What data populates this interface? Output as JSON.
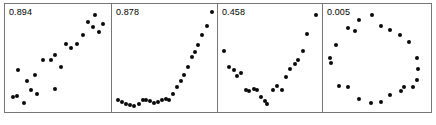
{
  "figure": {
    "name": "scatterplot-correlation-panels",
    "background": "#ffffff",
    "dot_color": "#0a0a0a",
    "border_color": "#777777",
    "panel_count": 4
  },
  "chart_data": [
    {
      "type": "scatter",
      "title": "0.894",
      "annotation": "0.894",
      "xlabel": "",
      "ylabel": "",
      "xlim": [
        0,
        1
      ],
      "ylim": [
        0,
        1
      ],
      "grid": false,
      "legend": null,
      "pattern": "positive-linear",
      "points": [
        [
          0.03,
          0.12
        ],
        [
          0.075,
          0.13
        ],
        [
          0.14,
          0.06
        ],
        [
          0.085,
          0.395
        ],
        [
          0.17,
          0.285
        ],
        [
          0.215,
          0.195
        ],
        [
          0.26,
          0.345
        ],
        [
          0.28,
          0.155
        ],
        [
          0.34,
          0.49
        ],
        [
          0.42,
          0.495
        ],
        [
          0.455,
          0.545
        ],
        [
          0.46,
          0.205
        ],
        [
          0.52,
          0.425
        ],
        [
          0.575,
          0.65
        ],
        [
          0.625,
          0.615
        ],
        [
          0.68,
          0.655
        ],
        [
          0.745,
          0.74
        ],
        [
          0.8,
          0.875
        ],
        [
          0.845,
          0.82
        ],
        [
          0.87,
          0.94
        ],
        [
          0.905,
          0.77
        ],
        [
          0.95,
          0.855
        ]
      ]
    },
    {
      "type": "scatter",
      "title": "0.878",
      "annotation": "0.878",
      "xlabel": "",
      "ylabel": "",
      "xlim": [
        0,
        1
      ],
      "ylim": [
        0,
        1
      ],
      "grid": false,
      "legend": null,
      "pattern": "exponential-monotonic",
      "points": [
        [
          0.015,
          0.09
        ],
        [
          0.055,
          0.075
        ],
        [
          0.095,
          0.055
        ],
        [
          0.135,
          0.04
        ],
        [
          0.18,
          0.035
        ],
        [
          0.225,
          0.055
        ],
        [
          0.265,
          0.09
        ],
        [
          0.3,
          0.095
        ],
        [
          0.34,
          0.085
        ],
        [
          0.38,
          0.065
        ],
        [
          0.42,
          0.07
        ],
        [
          0.46,
          0.095
        ],
        [
          0.5,
          0.1
        ],
        [
          0.54,
          0.09
        ],
        [
          0.58,
          0.155
        ],
        [
          0.62,
          0.22
        ],
        [
          0.655,
          0.285
        ],
        [
          0.695,
          0.34
        ],
        [
          0.735,
          0.425
        ],
        [
          0.775,
          0.52
        ],
        [
          0.8,
          0.57
        ],
        [
          0.84,
          0.64
        ],
        [
          0.88,
          0.745
        ],
        [
          0.925,
          0.83
        ],
        [
          0.975,
          0.97
        ]
      ]
    },
    {
      "type": "scatter",
      "title": "0.458",
      "annotation": "0.458",
      "xlabel": "",
      "ylabel": "",
      "xlim": [
        0,
        1
      ],
      "ylim": [
        0,
        1
      ],
      "grid": false,
      "legend": null,
      "pattern": "parabolic-u-shape",
      "points": [
        [
          0.01,
          0.58
        ],
        [
          0.065,
          0.425
        ],
        [
          0.11,
          0.39
        ],
        [
          0.15,
          0.33
        ],
        [
          0.185,
          0.365
        ],
        [
          0.235,
          0.195
        ],
        [
          0.275,
          0.185
        ],
        [
          0.32,
          0.205
        ],
        [
          0.35,
          0.19
        ],
        [
          0.395,
          0.12
        ],
        [
          0.435,
          0.085
        ],
        [
          0.455,
          0.05
        ],
        [
          0.52,
          0.195
        ],
        [
          0.56,
          0.23
        ],
        [
          0.61,
          0.195
        ],
        [
          0.66,
          0.32
        ],
        [
          0.7,
          0.4
        ],
        [
          0.755,
          0.45
        ],
        [
          0.785,
          0.49
        ],
        [
          0.83,
          0.58
        ],
        [
          0.88,
          0.755
        ],
        [
          0.965,
          0.945
        ]
      ]
    },
    {
      "type": "scatter",
      "title": "0.005",
      "annotation": "0.005",
      "xlabel": "",
      "ylabel": "",
      "xlim": [
        0,
        1
      ],
      "ylim": [
        0,
        1
      ],
      "grid": false,
      "legend": null,
      "pattern": "circular-ring",
      "points": [
        [
          0.44,
          0.945
        ],
        [
          0.305,
          0.89
        ],
        [
          0.195,
          0.815
        ],
        [
          0.265,
          0.78
        ],
        [
          0.075,
          0.64
        ],
        [
          0.02,
          0.51
        ],
        [
          0.03,
          0.465
        ],
        [
          0.11,
          0.23
        ],
        [
          0.195,
          0.225
        ],
        [
          0.31,
          0.1
        ],
        [
          0.425,
          0.065
        ],
        [
          0.53,
          0.07
        ],
        [
          0.615,
          0.14
        ],
        [
          0.725,
          0.185
        ],
        [
          0.76,
          0.22
        ],
        [
          0.85,
          0.225
        ],
        [
          0.885,
          0.29
        ],
        [
          0.9,
          0.4
        ],
        [
          0.885,
          0.51
        ],
        [
          0.805,
          0.67
        ],
        [
          0.72,
          0.745
        ],
        [
          0.62,
          0.79
        ],
        [
          0.53,
          0.83
        ]
      ]
    }
  ],
  "panels": [
    {
      "name": "panel-1",
      "label": "0.894",
      "width": 108
    },
    {
      "name": "panel-2",
      "label": "0.878",
      "width": 107
    },
    {
      "name": "panel-3",
      "label": "0.458",
      "width": 106
    },
    {
      "name": "panel-4",
      "label": "0.005",
      "width": 110
    }
  ]
}
